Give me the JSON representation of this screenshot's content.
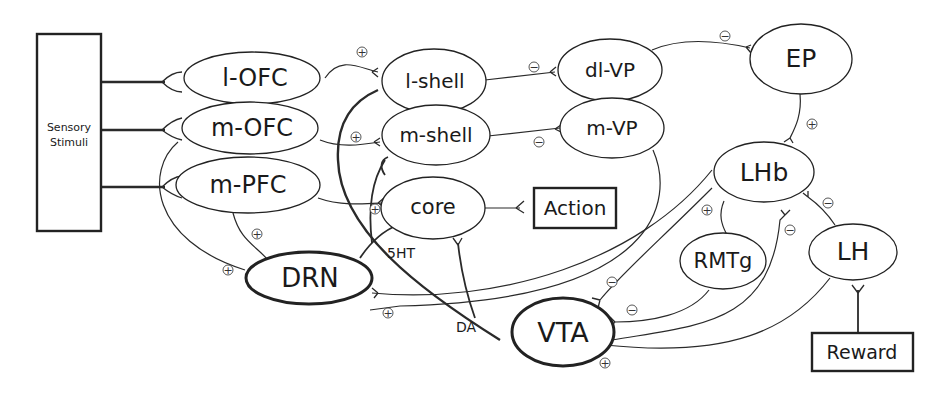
{
  "diagram": {
    "type": "neural-circuit",
    "nodes": {
      "sensory": {
        "label_line1": "Sensory",
        "label_line2": "Stimuli"
      },
      "lofc": {
        "label": "l-OFC"
      },
      "mofc": {
        "label": "m-OFC"
      },
      "mpfc": {
        "label": "m-PFC"
      },
      "lshell": {
        "label": "l-shell"
      },
      "mshell": {
        "label": "m-shell"
      },
      "core": {
        "label": "core"
      },
      "action": {
        "label": "Action"
      },
      "dlvp": {
        "label": "dl-VP"
      },
      "mvp": {
        "label": "m-VP"
      },
      "ep": {
        "label": "EP"
      },
      "lhb": {
        "label": "LHb"
      },
      "rmtg": {
        "label": "RMTg"
      },
      "lh": {
        "label": "LH"
      },
      "reward": {
        "label": "Reward"
      },
      "drn": {
        "label": "DRN"
      },
      "vta": {
        "label": "VTA"
      }
    },
    "edge_labels": {
      "serotonin": "5HT",
      "dopamine": "DA"
    },
    "signs": {
      "plus": "+",
      "minus": "−"
    },
    "edges": [
      {
        "from": "Sensory Stimuli",
        "to": "l-OFC"
      },
      {
        "from": "Sensory Stimuli",
        "to": "m-OFC"
      },
      {
        "from": "Sensory Stimuli",
        "to": "m-PFC"
      },
      {
        "from": "l-OFC",
        "to": "l-shell",
        "sign": "+"
      },
      {
        "from": "m-OFC",
        "to": "m-shell",
        "sign": "+"
      },
      {
        "from": "m-PFC",
        "to": "core",
        "sign": "+"
      },
      {
        "from": "m-PFC",
        "to": "DRN",
        "sign": "+"
      },
      {
        "from": "m-OFC",
        "to": "DRN",
        "sign": "+"
      },
      {
        "from": "l-shell",
        "to": "dl-VP",
        "sign": "−"
      },
      {
        "from": "m-shell",
        "to": "m-VP",
        "sign": "−"
      },
      {
        "from": "dl-VP",
        "to": "EP",
        "sign": "−"
      },
      {
        "from": "EP",
        "to": "LHb",
        "sign": "+"
      },
      {
        "from": "core",
        "to": "Action"
      },
      {
        "from": "LHb",
        "to": "RMTg",
        "sign": "+"
      },
      {
        "from": "LHb",
        "to": "VTA",
        "sign": "−"
      },
      {
        "from": "LHb",
        "to": "DRN",
        "sign": "−"
      },
      {
        "from": "RMTg",
        "to": "VTA",
        "sign": "−"
      },
      {
        "from": "VTA",
        "to": "LHb",
        "sign": "−"
      },
      {
        "from": "LH",
        "to": "LHb",
        "sign": "−"
      },
      {
        "from": "LH",
        "to": "VTA",
        "sign": "+"
      },
      {
        "from": "Reward",
        "to": "LH"
      },
      {
        "from": "DRN",
        "to": "core",
        "label": "5HT"
      },
      {
        "from": "VTA",
        "to": "l-shell / m-shell / core",
        "label": "DA"
      },
      {
        "from": "m-VP",
        "to": "VTA"
      },
      {
        "from": "VTA",
        "to": "DRN",
        "sign": "+"
      }
    ]
  }
}
